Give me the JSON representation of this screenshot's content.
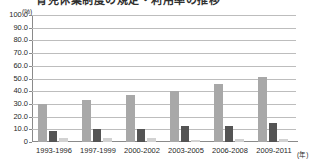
{
  "title": {
    "text": "育児休業制度の規定・利用率の推移",
    "clipped": true
  },
  "axis_units": {
    "y_unit": "(%)",
    "x_unit": "(年)"
  },
  "chart_data": {
    "type": "bar",
    "title": "育児休業制度の規定・利用率の推移",
    "xlabel": "(年)",
    "ylabel": "(%)",
    "ylim": [
      0,
      100
    ],
    "ytick_labels": [
      "100.0",
      "90.0",
      "80.0",
      "70.0",
      "60.0",
      "50.0",
      "40.0",
      "30.0",
      "20.0",
      "10.0",
      "0"
    ],
    "ytick_values": [
      100,
      90,
      80,
      70,
      60,
      50,
      40,
      30,
      20,
      10,
      0
    ],
    "grid": true,
    "legend": "none",
    "categories": [
      "1993-1996",
      "1997-1999",
      "2000-2002",
      "2003-2005",
      "2006-2008",
      "2009-2011"
    ],
    "series": [
      {
        "name": "series-1",
        "color": "#a8a8a8",
        "values": [
          30.0,
          33.0,
          37.0,
          40.0,
          45.5,
          51.0
        ]
      },
      {
        "name": "series-2",
        "color": "#545454",
        "values": [
          8.5,
          10.0,
          10.0,
          12.5,
          12.5,
          15.0
        ]
      },
      {
        "name": "series-3",
        "color": "#d2d2d2",
        "values": [
          3.0,
          2.8,
          3.0,
          1.5,
          2.5,
          2.5
        ]
      }
    ]
  },
  "colors": {
    "series_1": "#a8a8a8",
    "series_2": "#545454",
    "series_3": "#d2d2d2",
    "gridline": "#bdbdbd",
    "axis": "#8a8a8a",
    "background": "#ffffff"
  }
}
